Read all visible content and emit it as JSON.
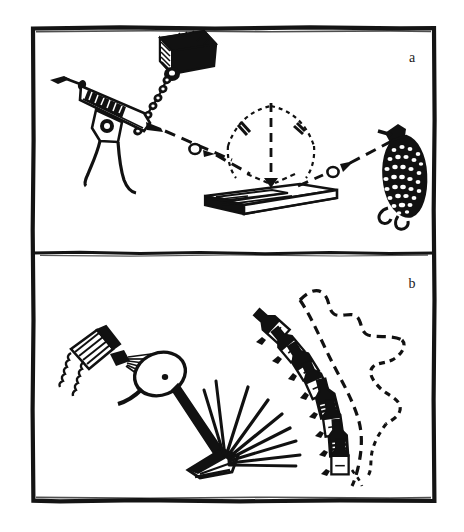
{
  "figure": {
    "type": "two-panel scientific line illustration (scanned halftone)",
    "background_color": "#ffffff",
    "ink_color": "#111111",
    "frame": {
      "outer_border_color": "#141414",
      "outer_border_width_px": 4,
      "divider_color": "#141414",
      "divider_width_px": 3,
      "x": 32,
      "y": 27,
      "width": 403,
      "height": 475,
      "divider_y": 253
    },
    "panels": [
      {
        "id": "panel-a",
        "label": "a",
        "label_x": 412,
        "label_y": 62,
        "caption_text": "a",
        "elements": [
          "chain-suspended clamp block",
          "beaded chain",
          "syringe injection gun",
          "dashed projectile trajectory",
          "circular projectile marker",
          "arrowhead",
          "angle arc with tick marks",
          "vertical dashed normal axis",
          "flat plate on base",
          "mesh textured specimen"
        ]
      },
      {
        "id": "panel-b",
        "label": "b",
        "label_x": 412,
        "label_y": 288,
        "caption_text": "b",
        "elements": [
          "atomizer spray bottle",
          "spray cone",
          "oval target disc on rod",
          "wedge blade",
          "fan of rays",
          "arc of bottles",
          "irregular dotted boundary curve"
        ]
      }
    ],
    "bottle_arc": {
      "count": 8,
      "description": "row of stoppered bottles arranged along a descending arc, each progressively rotated",
      "items": [
        {
          "index": 1,
          "cx": 271,
          "cy": 325,
          "rotation_deg": -48,
          "scale": 1.0
        },
        {
          "index": 2,
          "cx": 287,
          "cy": 344,
          "rotation_deg": -40,
          "scale": 0.98
        },
        {
          "index": 3,
          "cx": 302,
          "cy": 360,
          "rotation_deg": -32,
          "scale": 1.02
        },
        {
          "index": 4,
          "cx": 314,
          "cy": 379,
          "rotation_deg": -24,
          "scale": 1.0
        },
        {
          "index": 5,
          "cx": 325,
          "cy": 398,
          "rotation_deg": -14,
          "scale": 1.04
        },
        {
          "index": 6,
          "cx": 331,
          "cy": 419,
          "rotation_deg": -8,
          "scale": 0.98
        },
        {
          "index": 7,
          "cx": 337,
          "cy": 438,
          "rotation_deg": -4,
          "scale": 1.0
        },
        {
          "index": 8,
          "cx": 340,
          "cy": 457,
          "rotation_deg": 0,
          "scale": 0.96
        }
      ]
    },
    "ray_fan": {
      "count": 9,
      "origin_x": 222,
      "origin_y": 460,
      "description": "straight rays emitted from the wedge blade tip"
    },
    "trajectory": {
      "style": "dashed",
      "markers": [
        "circle",
        "arrowhead"
      ],
      "segments": 2
    }
  }
}
